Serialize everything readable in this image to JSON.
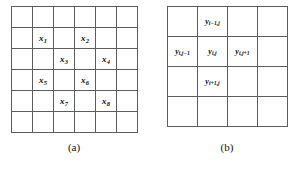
{
  "figure": {
    "panels": [
      {
        "id": "a",
        "caption": "(a)",
        "grid": {
          "rows": 6,
          "cols": 6
        },
        "labels": [
          {
            "row": 2,
            "col": 2,
            "base": "x",
            "sub": "1",
            "text": "x1"
          },
          {
            "row": 2,
            "col": 4,
            "base": "x",
            "sub": "2",
            "text": "x2"
          },
          {
            "row": 3,
            "col": 3,
            "base": "x",
            "sub": "3",
            "text": "x3"
          },
          {
            "row": 3,
            "col": 5,
            "base": "x",
            "sub": "4",
            "text": "x4"
          },
          {
            "row": 4,
            "col": 2,
            "base": "x",
            "sub": "5",
            "text": "x5"
          },
          {
            "row": 4,
            "col": 4,
            "base": "x",
            "sub": "6",
            "text": "x6"
          },
          {
            "row": 5,
            "col": 3,
            "base": "x",
            "sub": "7",
            "text": "x7"
          },
          {
            "row": 5,
            "col": 5,
            "base": "x",
            "sub": "8",
            "text": "x8"
          }
        ]
      },
      {
        "id": "b",
        "caption": "(b)",
        "grid": {
          "rows": 4,
          "cols": 4
        },
        "labels": [
          {
            "row": 1,
            "col": 2,
            "base": "y",
            "sub": "i−1,j",
            "text": "yi−1,j"
          },
          {
            "row": 2,
            "col": 1,
            "base": "y",
            "sub": "i,j−1",
            "text": "yi,j−1"
          },
          {
            "row": 2,
            "col": 2,
            "base": "y",
            "sub": "i,j",
            "text": "yi,j"
          },
          {
            "row": 2,
            "col": 3,
            "base": "y",
            "sub": "i,j+1",
            "text": "yi,j+1"
          },
          {
            "row": 3,
            "col": 2,
            "base": "y",
            "sub": "i+1,j",
            "text": "yi+1,j"
          }
        ]
      }
    ]
  },
  "colors": {
    "grid_line": "#5d5d5d",
    "background": "#ffffff",
    "text": "#111111"
  }
}
